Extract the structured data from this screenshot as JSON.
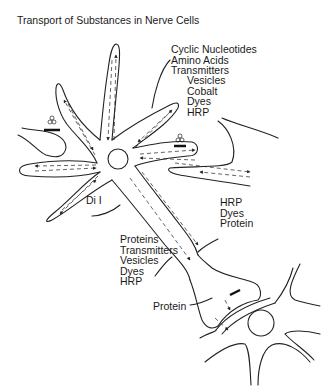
{
  "title": "Transport of Substances in Nerve Cells",
  "labels": {
    "dendrite_group": [
      "Cyclic Nucleotides",
      "Amino Acids",
      "Transmitters"
    ],
    "dendrite_group_2": [
      "Vesicles",
      "Cobalt",
      "Dyes",
      "HRP"
    ],
    "dil": "Di I",
    "retrograde_group": [
      "HRP",
      "Dyes",
      "Protein"
    ],
    "anterograde_group": [
      "Proteins",
      "Transmitters",
      "Vesicles",
      "Dyes",
      "HRP"
    ],
    "transsynaptic": "Protein"
  },
  "colors": {
    "line": "#222222",
    "text": "#1a1a1a",
    "background": "#ffffff"
  }
}
